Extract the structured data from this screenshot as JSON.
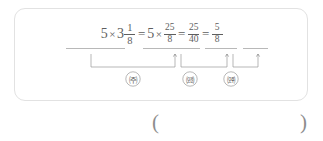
{
  "problem": {
    "equation": {
      "terms": [
        {
          "id": "term-1",
          "whole": "5",
          "operator": "×",
          "mixed_whole": "3",
          "fraction": {
            "numerator": "1",
            "denominator": "8"
          }
        },
        {
          "id": "term-2",
          "whole": "5",
          "operator": "×",
          "fraction": {
            "numerator": "25",
            "denominator": "8"
          }
        },
        {
          "id": "term-3",
          "fraction": {
            "numerator": "25",
            "denominator": "40"
          }
        },
        {
          "id": "term-4",
          "fraction": {
            "numerator": "5",
            "denominator": "8"
          }
        }
      ],
      "equals_sign": "=",
      "multiply_sign": "×",
      "plain_text": "5 × 3 1/8 = 5 × 25/8 = 25/40 = 5/8"
    },
    "step_labels": [
      {
        "id": "step-a",
        "label": "㈜",
        "reading": "circled-giyeok"
      },
      {
        "id": "step-b",
        "label": "㈝",
        "reading": "circled-nieun"
      },
      {
        "id": "step-c",
        "label": "㈞",
        "reading": "circled-digeut"
      }
    ]
  },
  "answer": {
    "paren_open": "(",
    "paren_close": ")",
    "value": ""
  },
  "colors": {
    "box_border": "#e2e2e2",
    "text": "#5e5e5e",
    "annotation_line": "#9a9a9a",
    "paren": "#8d8d8d",
    "background": "#ffffff"
  }
}
